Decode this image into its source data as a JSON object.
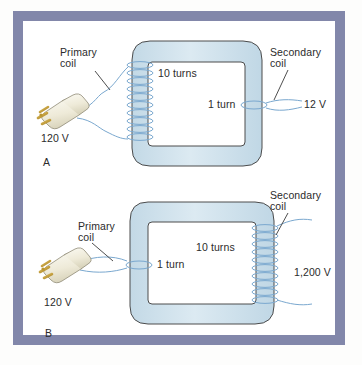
{
  "figure": {
    "panels": [
      {
        "letter": "A",
        "type": "step-down transformer",
        "primary_label": "Primary\ncoil",
        "primary_turns_label": "10 turns",
        "primary_turns": 10,
        "primary_side": "left",
        "secondary_label": "Secondary\ncoil",
        "secondary_turns_label": "1 turn",
        "secondary_turns": 1,
        "secondary_side": "right",
        "input_voltage": "120 V",
        "output_voltage": "12 V"
      },
      {
        "letter": "B",
        "type": "step-up transformer",
        "primary_label": "Primary\ncoil",
        "primary_turns_label": "1 turn",
        "primary_turns": 1,
        "primary_side": "left",
        "secondary_label": "Secondary\ncoil",
        "secondary_turns_label": "10 turns",
        "secondary_turns": 10,
        "secondary_side": "right",
        "input_voltage": "120 V",
        "output_voltage": "1,200 V"
      }
    ]
  },
  "colors": {
    "frame": "#8287aa",
    "core_fill": "#cfe0ea",
    "core_stroke": "#4a4a4a",
    "coil_wire": "#7aa8cf",
    "lead_wire": "#7aa8cf",
    "plug_body": "#f2efe2",
    "plug_prong": "#c8a23c",
    "text": "#2b2b2b",
    "background": "#ffffff"
  },
  "text_items": {
    "a_primary_line1": "Primary",
    "a_primary_line2": "coil",
    "a_turns_primary": "10 turns",
    "a_secondary_line1": "Secondary",
    "a_secondary_line2": "coil",
    "a_turns_secondary": "1 turn",
    "a_input": "120 V",
    "a_output": "12 V",
    "a_letter": "A",
    "b_primary_line1": "Primary",
    "b_primary_line2": "coil",
    "b_turns_primary": "1 turn",
    "b_secondary_line1": "Secondary",
    "b_secondary_line2": "coil",
    "b_turns_secondary": "10 turns",
    "b_input": "120 V",
    "b_output": "1,200 V",
    "b_letter": "B"
  }
}
